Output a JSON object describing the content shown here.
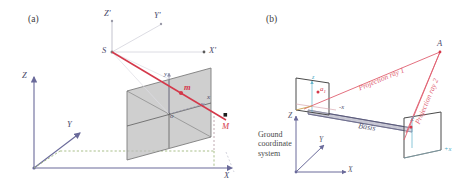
{
  "figure": {
    "panels": [
      {
        "tag": "(a)",
        "name": "single-camera-projection",
        "labels": {
          "center": "S",
          "axis_x_prime": "X'",
          "axis_y_prime": "Y'",
          "axis_z_prime": "Z'",
          "image_origin": "o",
          "image_x": "x",
          "image_y": "y",
          "image_point": "m",
          "object_point": "M",
          "world_x": "X",
          "world_y": "Y",
          "world_z": "Z"
        }
      },
      {
        "tag": "(b)",
        "name": "stereo-pair-projection",
        "labels": {
          "object_point": "A",
          "ray1": "Projection ray 1",
          "ray2": "Projection ray 2",
          "basis": "Basis",
          "ground_system": [
            "Ground",
            "coordinate",
            "system"
          ],
          "left_image_point": "a",
          "left_image_point_sub": "1",
          "left_image_z": "z",
          "left_image_x": "-x",
          "right_image_z": "z",
          "right_image_x": "+x",
          "world_x": "X",
          "world_y": "Y",
          "world_z": "Z"
        }
      }
    ],
    "colors": {
      "ray_red": "#d4384a",
      "ray_red_light": "#e06070",
      "axis_blue": "#6a6a9a",
      "axis_cyan": "#49a9c4",
      "ground_green": "#8fb36a",
      "plane_fill": "#b9b9b9",
      "plane_edge": "#7a7a7a",
      "text": "#3a3a3a"
    }
  }
}
